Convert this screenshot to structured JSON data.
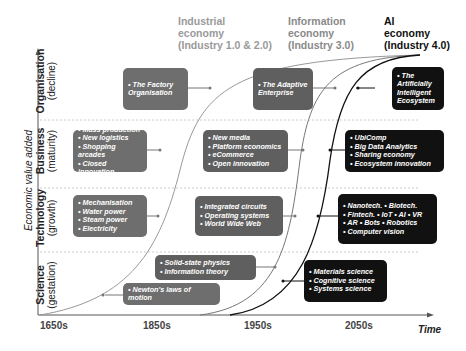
{
  "eras": [
    {
      "title": "Industrial economy (Industry 1.0 & 2.0)",
      "lines": [
        "Industrial",
        "economy",
        "(Industry 1.0 & 2.0)"
      ]
    },
    {
      "title": "Information economy (Industry 3.0)",
      "lines": [
        "Information",
        "economy",
        "(Industry 3.0)"
      ]
    },
    {
      "title": "AI economy (Industry 4.0)",
      "lines": [
        "AI",
        "economy",
        "(Industry 4.0)"
      ]
    }
  ],
  "y_axis_label": "Economic value added",
  "x_axis_label": "Time",
  "x_ticks": [
    "1650s",
    "1850s",
    "1950s",
    "2050s"
  ],
  "stages": [
    {
      "name": "Organisation",
      "phase": "(decline)"
    },
    {
      "name": "Business",
      "phase": "(maturity)"
    },
    {
      "name": "Technology",
      "phase": "(growth)"
    },
    {
      "name": "Science",
      "phase": "(gestation)"
    }
  ],
  "boxes": {
    "industrial": {
      "organisation": [
        "The Factory Organisation"
      ],
      "business": [
        "Mass production",
        "New logistics",
        "Shopping arcades",
        "Closed innovation"
      ],
      "technology": [
        "Mechanisation",
        "Water power",
        "Steam power",
        "Electricity"
      ],
      "science": [
        "Newton's laws of motion"
      ]
    },
    "information": {
      "organisation": [
        "The Adaptive Enterprise"
      ],
      "business": [
        "New media",
        "Platform economics",
        "eCommerce",
        "Open innovation"
      ],
      "technology": [
        "Integrated circuits",
        "Operating systems",
        "World Wide Web"
      ],
      "science": [
        "Solid-state physics",
        "Information theory"
      ]
    },
    "ai": {
      "organisation": [
        "The Artificially Intelligent Ecosystem"
      ],
      "business": [
        "UbiComp",
        "Big Data Analytics",
        "Sharing economy",
        "Ecosystem innovation"
      ],
      "technology": [
        "Nanotech. • Biotech.",
        "Fintech. • IoT • AI • VR",
        "AR • Bots • Robotics",
        "Computer vision"
      ],
      "science": [
        "Materials science",
        "Cognitive science",
        "Systems science"
      ]
    }
  },
  "colors": {
    "industrial": "#6e6e6e",
    "information": "#5f5f5f",
    "ai": "#111111"
  }
}
